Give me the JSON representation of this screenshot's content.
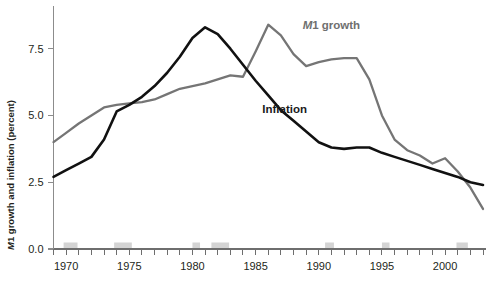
{
  "chart_data": {
    "type": "line",
    "title": "",
    "xlabel": "",
    "ylabel": "M1 growth and inflation (percent)",
    "ylabel_italic_prefix": "M",
    "ylabel_rest": "1 growth and inflation (percent)",
    "xlim": [
      1969,
      2003
    ],
    "ylim": [
      0.0,
      8.8
    ],
    "yticks": [
      0.0,
      2.5,
      5.0,
      7.5
    ],
    "ytick_labels": [
      "0.0",
      "2.5",
      "5.0",
      "7.5"
    ],
    "xticks": [
      1970,
      1975,
      1980,
      1985,
      1990,
      1995,
      2000
    ],
    "xtick_labels": [
      "1970",
      "1975",
      "1980",
      "1985",
      "1990",
      "1995",
      "2000"
    ],
    "x_minor_tick_interval": 1,
    "grid": false,
    "legend_position": "inline-annotation",
    "x": [
      1969,
      1970,
      1971,
      1972,
      1973,
      1974,
      1975,
      1976,
      1977,
      1978,
      1979,
      1980,
      1981,
      1982,
      1983,
      1984,
      1985,
      1986,
      1987,
      1988,
      1989,
      1990,
      1991,
      1992,
      1993,
      1994,
      1995,
      1996,
      1997,
      1998,
      1999,
      2000,
      2001,
      2002,
      2003
    ],
    "series": [
      {
        "name": "M1 growth",
        "color": "#757575",
        "label": "M1 growth",
        "label_italic_prefix": "M",
        "label_rest": "1 growth",
        "label_x": 1991.0,
        "label_y": 8.25,
        "values": [
          4.0,
          4.35,
          4.7,
          5.0,
          5.3,
          5.4,
          5.45,
          5.5,
          5.6,
          5.8,
          6.0,
          6.1,
          6.2,
          6.35,
          6.5,
          6.45,
          7.4,
          8.4,
          8.0,
          7.3,
          6.85,
          7.0,
          7.1,
          7.15,
          7.15,
          6.35,
          5.0,
          4.1,
          3.7,
          3.5,
          3.2,
          3.4,
          2.9,
          2.3,
          1.5
        ]
      },
      {
        "name": "Inflation",
        "color": "#111111",
        "label": "Inflation",
        "label_x": 1987.3,
        "label_y": 5.1,
        "values": [
          2.7,
          2.95,
          3.2,
          3.45,
          4.1,
          5.15,
          5.4,
          5.7,
          6.1,
          6.6,
          7.2,
          7.9,
          8.3,
          8.05,
          7.5,
          6.9,
          6.3,
          5.75,
          5.2,
          4.8,
          4.4,
          4.0,
          3.8,
          3.75,
          3.8,
          3.8,
          3.6,
          3.45,
          3.3,
          3.15,
          3.0,
          2.85,
          2.7,
          2.5,
          2.4
        ]
      }
    ],
    "recession_bands": [
      {
        "start": 1969.8,
        "end": 1970.9
      },
      {
        "start": 1973.8,
        "end": 1975.2
      },
      {
        "start": 1980.0,
        "end": 1980.6
      },
      {
        "start": 1981.5,
        "end": 1982.9
      },
      {
        "start": 1990.5,
        "end": 1991.2
      },
      {
        "start": 1995.0,
        "end": 1995.6
      },
      {
        "start": 2000.9,
        "end": 2001.8
      }
    ]
  }
}
